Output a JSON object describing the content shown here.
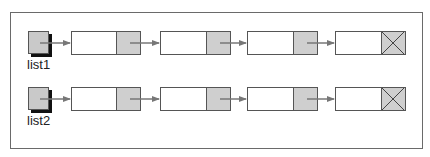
{
  "diagram": {
    "title": "",
    "lists": [
      {
        "label": "list1",
        "nodes": 4,
        "terminator": "null"
      },
      {
        "label": "list2",
        "nodes": 4,
        "terminator": "null"
      }
    ],
    "node_parts": [
      "data",
      "next-pointer"
    ],
    "colors": {
      "frame": "#6a6a6a",
      "pointer_cell": "#cfcfcf",
      "head": "#c9c9c9",
      "arrow": "#777777",
      "shadow": "#111111"
    }
  }
}
